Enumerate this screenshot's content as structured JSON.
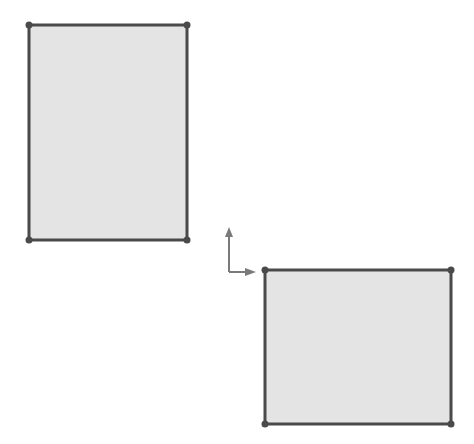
{
  "colors": {
    "background": "#ffffff",
    "fill": "#e4e4e4",
    "stroke": "#4a4a4a",
    "axis": "#7a7a7a"
  },
  "rectangles": [
    {
      "name": "sketch-rectangle-1",
      "x1": 29,
      "y1": 25,
      "x2": 187,
      "y2": 240
    },
    {
      "name": "sketch-rectangle-2",
      "x1": 265,
      "y1": 270,
      "x2": 451,
      "y2": 424
    }
  ],
  "origin": {
    "x": 229,
    "y": 272,
    "arrow_length": 45
  }
}
